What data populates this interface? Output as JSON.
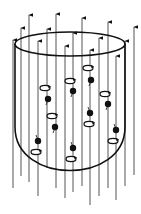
{
  "figure": {
    "description": "Cylindrical vessel with vertical field-line arrows passing through it and spinning particles (dots with circular spin arrows) inside",
    "stroke_color": "#111111",
    "field_line_color": "#555555",
    "background": "#ffffff"
  },
  "vessel": {
    "rim": {
      "cx": 70,
      "cy": 44,
      "rx": 55,
      "ry": 12
    },
    "left_x": 15,
    "right_x": 125,
    "wall_top_y": 44,
    "bottom_y": 177
  },
  "field_lines": [
    {
      "x": 13,
      "top": 40,
      "bottom": 188
    },
    {
      "x": 21,
      "top": 28,
      "bottom": 176
    },
    {
      "x": 29,
      "top": 15,
      "bottom": 182
    },
    {
      "x": 38,
      "top": 41,
      "bottom": 196
    },
    {
      "x": 47,
      "top": 29,
      "bottom": 168
    },
    {
      "x": 56,
      "top": 14,
      "bottom": 188
    },
    {
      "x": 65,
      "top": 46,
      "bottom": 198
    },
    {
      "x": 73,
      "top": 33,
      "bottom": 192
    },
    {
      "x": 82,
      "top": 18,
      "bottom": 186
    },
    {
      "x": 90,
      "top": 50,
      "bottom": 205
    },
    {
      "x": 99,
      "top": 38,
      "bottom": 196
    },
    {
      "x": 108,
      "top": 22,
      "bottom": 188
    },
    {
      "x": 116,
      "top": 56,
      "bottom": 200
    },
    {
      "x": 125,
      "top": 41,
      "bottom": 186
    },
    {
      "x": 134,
      "top": 27,
      "bottom": 175
    }
  ],
  "particles": [
    {
      "dot": [
        48,
        99
      ],
      "ring": [
        45,
        88
      ]
    },
    {
      "dot": [
        73,
        91
      ],
      "ring": [
        70,
        81
      ]
    },
    {
      "dot": [
        91,
        80
      ],
      "ring": [
        88,
        68
      ]
    },
    {
      "dot": [
        108,
        104
      ],
      "ring": [
        105,
        94
      ]
    },
    {
      "dot": [
        55,
        127
      ],
      "ring": [
        52,
        116
      ]
    },
    {
      "dot": [
        90,
        113
      ],
      "ring": [
        89,
        124
      ]
    },
    {
      "dot": [
        38,
        141
      ],
      "ring": [
        36,
        152
      ]
    },
    {
      "dot": [
        73,
        148
      ],
      "ring": [
        71,
        159
      ]
    },
    {
      "dot": [
        116,
        130
      ],
      "ring": [
        113,
        141
      ]
    }
  ]
}
